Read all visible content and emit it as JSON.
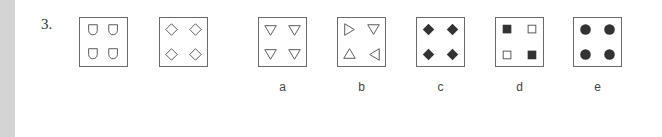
{
  "question": {
    "number": "3."
  },
  "sequence": [
    {
      "id": "s1",
      "shape": "shield-outline",
      "x": 79
    },
    {
      "id": "s2",
      "shape": "diamond-outline",
      "x": 159
    }
  ],
  "options": [
    {
      "id": "a",
      "label": "a",
      "shape": "triangle-down-outline",
      "x": 258
    },
    {
      "id": "b",
      "label": "b",
      "shape": "triangles-rotating-outline",
      "x": 337
    },
    {
      "id": "c",
      "label": "c",
      "shape": "diamond-filled",
      "x": 416
    },
    {
      "id": "d",
      "label": "d",
      "shape": "squares-checker",
      "x": 495
    },
    {
      "id": "e",
      "label": "e",
      "shape": "circle-filled",
      "x": 573
    }
  ],
  "colors": {
    "stroke": "#555555",
    "fill": "#333333",
    "border": "#6a6a6a",
    "margin": "#d4d4d4"
  }
}
